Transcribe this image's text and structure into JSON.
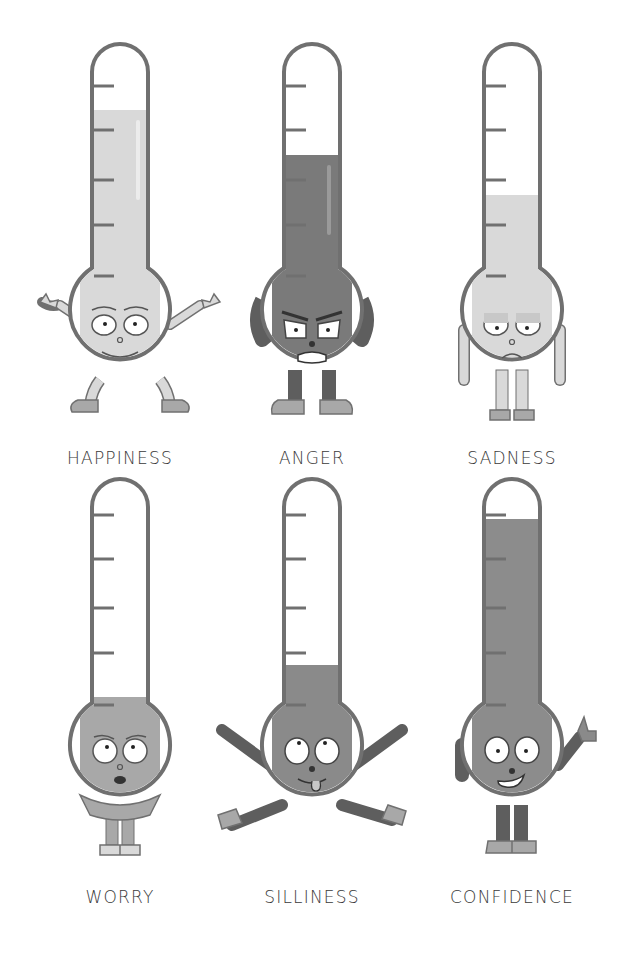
{
  "page": {
    "colors": {
      "background": "#ffffff",
      "outline": "#707070",
      "light_fill": "#d9d9d9",
      "medium_fill": "#a8a8a8",
      "dark_fill": "#7a7a7a",
      "limb_dark": "#5e5e5e",
      "label_text": "#3a3a3a"
    }
  },
  "thermometers": [
    {
      "label": "HAPPINESS",
      "fill_percent": 80,
      "shade": "light",
      "expression": "happy",
      "pose": "arms-out-pointing"
    },
    {
      "label": "ANGER",
      "fill_percent": 65,
      "shade": "dark",
      "expression": "angry",
      "pose": "hands-on-hips"
    },
    {
      "label": "SADNESS",
      "fill_percent": 45,
      "shade": "light",
      "expression": "sad",
      "pose": "arms-down"
    },
    {
      "label": "WORRY",
      "fill_percent": 15,
      "shade": "medium",
      "expression": "worried",
      "pose": "hugging-self"
    },
    {
      "label": "SILLINESS",
      "fill_percent": 30,
      "shade": "dark-medium",
      "expression": "silly-tongue-out",
      "pose": "star-jump"
    },
    {
      "label": "CONFIDENCE",
      "fill_percent": 95,
      "shade": "medium-dark",
      "expression": "confident-grin",
      "pose": "thumbs-up"
    }
  ]
}
